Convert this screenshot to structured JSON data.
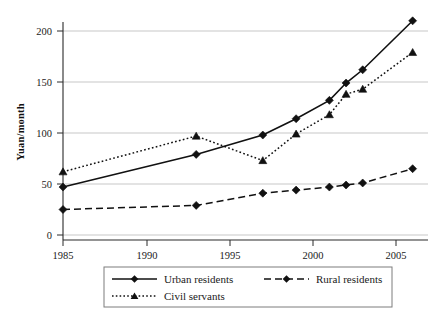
{
  "chart_data": {
    "type": "line",
    "title": "",
    "xlabel": "",
    "ylabel": "Yuan/month",
    "xlim": [
      1985,
      2006
    ],
    "ylim": [
      0,
      215
    ],
    "yticks": [
      0,
      50,
      100,
      150,
      200
    ],
    "xticks": [
      1985,
      1990,
      1995,
      2000,
      2005
    ],
    "grid": "horizontal",
    "legend_position": "bottom",
    "series": [
      {
        "name": "Urban residents",
        "style": "solid",
        "marker": "diamond",
        "x": [
          1985,
          1993,
          1997,
          1999,
          2001,
          2002,
          2003,
          2006
        ],
        "values": [
          47,
          79,
          98,
          114,
          132,
          149,
          162,
          210
        ]
      },
      {
        "name": "Rural residents",
        "style": "dashed",
        "marker": "diamond",
        "x": [
          1985,
          1993,
          1997,
          1999,
          2001,
          2002,
          2003,
          2006
        ],
        "values": [
          25,
          29,
          41,
          44,
          47,
          49,
          51,
          65
        ]
      },
      {
        "name": "Civil servants",
        "style": "dotted",
        "marker": "triangle",
        "x": [
          1985,
          1993,
          1997,
          1999,
          2001,
          2002,
          2003,
          2006
        ],
        "values": [
          62,
          97,
          73,
          99,
          118,
          138,
          143,
          179
        ]
      }
    ]
  },
  "axis": {
    "y_title": "Yuan/month",
    "y_tick_labels": [
      "0",
      "50",
      "100",
      "150",
      "200"
    ],
    "x_tick_labels": [
      "1985",
      "1990",
      "1995",
      "2000",
      "2005"
    ]
  },
  "legend": {
    "entries": [
      {
        "label": "Urban residents"
      },
      {
        "label": "Rural residents"
      },
      {
        "label": "Civil servants"
      }
    ]
  },
  "colors": {
    "ink": "#111111",
    "grid": "#b9b9b9",
    "legend_border": "#7d7d7d",
    "background": "#ffffff"
  }
}
